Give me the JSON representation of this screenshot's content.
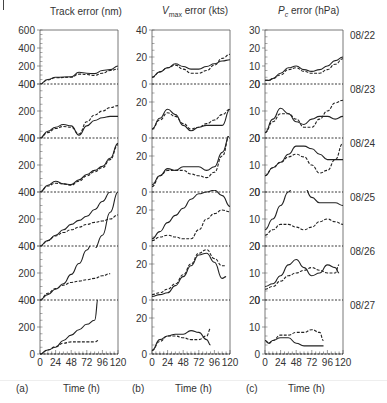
{
  "figure": {
    "panel_labels": [
      "(a)",
      "(b)",
      "(c)"
    ],
    "xlabel": "Time (h)",
    "x_ticks": [
      "0",
      "24",
      "48",
      "72",
      "96",
      "120"
    ],
    "dates": [
      "08/22",
      "08/23",
      "08/24",
      "08/25",
      "08/26",
      "08/27"
    ],
    "titles": [
      "Track error (nm)",
      "V",
      "max",
      " error (kts)",
      "P",
      "c",
      " error (hPa)"
    ]
  },
  "colors": {
    "line": "#222222",
    "axis": "#555555",
    "text": "#333333"
  },
  "chart_data": [
    {
      "type": "line",
      "title": "Track error (nm)",
      "panel": "(a)",
      "xlabel": "Time (h)",
      "ylabel": "Track error (nm)",
      "x_ticks": [
        0,
        24,
        48,
        72,
        96,
        120
      ],
      "y_ticks": [
        0,
        200,
        400,
        600
      ],
      "rows": [
        {
          "date": "08/22",
          "ylim": [
            0,
            600
          ],
          "x": [
            0,
            12,
            24,
            48,
            60,
            72,
            84,
            96,
            108,
            120
          ],
          "series": [
            {
              "name": "solid",
              "values": [
                0,
                50,
                75,
                80,
                130,
                120,
                115,
                150,
                160,
                200
              ]
            },
            {
              "name": "dashed",
              "values": [
                0,
                45,
                70,
                75,
                110,
                105,
                95,
                120,
                150,
                165
              ]
            }
          ]
        },
        {
          "date": "08/23",
          "ylim": [
            0,
            400
          ],
          "x": [
            0,
            12,
            24,
            36,
            48,
            60,
            72,
            84,
            96,
            108,
            120
          ],
          "series": [
            {
              "name": "solid",
              "values": [
                0,
                50,
                80,
                100,
                90,
                20,
                90,
                130,
                150,
                160,
                160
              ]
            },
            {
              "name": "dashed",
              "values": [
                0,
                40,
                70,
                85,
                80,
                30,
                120,
                170,
                200,
                225,
                240
              ]
            }
          ]
        },
        {
          "date": "08/24",
          "ylim": [
            0,
            400
          ],
          "x": [
            0,
            12,
            24,
            36,
            48,
            60,
            72,
            84,
            96,
            108,
            120
          ],
          "series": [
            {
              "name": "solid",
              "values": [
                0,
                50,
                80,
                60,
                55,
                90,
                130,
                160,
                190,
                250,
                360
              ]
            },
            {
              "name": "dashed",
              "values": [
                0,
                45,
                65,
                60,
                50,
                80,
                120,
                150,
                180,
                240,
                350
              ]
            }
          ]
        },
        {
          "date": "08/25",
          "ylim": [
            0,
            400
          ],
          "x": [
            0,
            12,
            24,
            36,
            48,
            60,
            72,
            84,
            96,
            108,
            120
          ],
          "series": [
            {
              "name": "solid",
              "values": [
                0,
                40,
                80,
                120,
                160,
                190,
                220,
                270,
                330,
                400,
                490
              ]
            },
            {
              "name": "dashed",
              "values": [
                0,
                40,
                75,
                100,
                120,
                140,
                160,
                175,
                185,
                200,
                230
              ]
            },
            {
              "name": "solid-2",
              "values": [
                null,
                null,
                null,
                null,
                null,
                null,
                -60,
                -20,
                80,
                250,
                400
              ]
            }
          ]
        },
        {
          "date": "08/26",
          "ylim": [
            0,
            400
          ],
          "x": [
            0,
            12,
            24,
            36,
            48,
            60,
            72,
            84,
            96,
            108
          ],
          "series": [
            {
              "name": "solid",
              "values": [
                0,
                40,
                80,
                120,
                190,
                270,
                370,
                480,
                null,
                null
              ]
            },
            {
              "name": "dashed",
              "values": [
                0,
                50,
                85,
                110,
                130,
                140,
                150,
                160,
                180,
                195
              ]
            }
          ]
        },
        {
          "date": "08/27",
          "ylim": [
            0,
            400
          ],
          "x": [
            0,
            12,
            24,
            36,
            48,
            60,
            72,
            84,
            90
          ],
          "series": [
            {
              "name": "solid",
              "values": [
                0,
                30,
                50,
                100,
                140,
                180,
                220,
                250,
                430
              ]
            },
            {
              "name": "dashed",
              "values": [
                0,
                30,
                55,
                80,
                90,
                90,
                90,
                90,
                100
              ]
            }
          ]
        }
      ]
    },
    {
      "type": "line",
      "title": "Vmax error (kts)",
      "panel": "(b)",
      "xlabel": "Time (h)",
      "ylabel": "Vmax error (kts)",
      "x_ticks": [
        0,
        24,
        48,
        72,
        96,
        120
      ],
      "y_ticks": [
        0,
        20,
        40
      ],
      "rows": [
        {
          "date": "08/22",
          "ylim": [
            0,
            40
          ],
          "x": [
            0,
            12,
            24,
            36,
            48,
            60,
            72,
            84,
            96,
            108,
            120
          ],
          "series": [
            {
              "name": "solid",
              "values": [
                5,
                9,
                12,
                15,
                13,
                11,
                11,
                13,
                15,
                17,
                18
              ]
            },
            {
              "name": "dashed",
              "values": [
                5,
                9,
                12,
                14,
                11,
                8,
                8,
                10,
                14,
                19,
                22
              ]
            }
          ]
        },
        {
          "date": "08/23",
          "ylim": [
            0,
            30
          ],
          "x": [
            0,
            12,
            24,
            36,
            48,
            60,
            72,
            84,
            96,
            108,
            120
          ],
          "series": [
            {
              "name": "solid",
              "values": [
                5,
                11,
                16,
                13,
                7,
                4,
                6,
                7,
                7,
                7,
                16
              ]
            },
            {
              "name": "dashed",
              "values": [
                5,
                10,
                14,
                12,
                8,
                5,
                6,
                8,
                10,
                13,
                16
              ]
            }
          ]
        },
        {
          "date": "08/24",
          "ylim": [
            0,
            30
          ],
          "x": [
            0,
            12,
            24,
            36,
            48,
            60,
            72,
            84,
            96,
            108,
            120
          ],
          "series": [
            {
              "name": "solid",
              "values": [
                4,
                9,
                13,
                12,
                14,
                14,
                14,
                12,
                14,
                22,
                32
              ]
            },
            {
              "name": "dashed",
              "values": [
                3,
                9,
                12,
                12,
                12,
                10,
                9,
                8,
                11,
                20,
                32
              ]
            }
          ]
        },
        {
          "date": "08/25",
          "ylim": [
            0,
            30
          ],
          "x": [
            0,
            12,
            24,
            36,
            48,
            60,
            72,
            84,
            96,
            108,
            120
          ],
          "series": [
            {
              "name": "solid",
              "values": [
                4,
                8,
                13,
                17,
                21,
                26,
                29,
                30,
                31,
                28,
                22
              ]
            },
            {
              "name": "dashed",
              "values": [
                3,
                5,
                6,
                5,
                4,
                4,
                9,
                15,
                18,
                20,
                19
              ]
            }
          ]
        },
        {
          "date": "08/26",
          "ylim": [
            0,
            30
          ],
          "x": [
            0,
            12,
            24,
            36,
            48,
            60,
            72,
            84,
            96,
            108,
            114
          ],
          "series": [
            {
              "name": "solid",
              "values": [
                2,
                3,
                4,
                8,
                13,
                19,
                25,
                26,
                21,
                12,
                13
              ]
            },
            {
              "name": "dashed",
              "values": [
                3,
                4,
                6,
                9,
                14,
                20,
                26,
                28,
                23,
                19,
                19
              ]
            }
          ]
        },
        {
          "date": "08/27",
          "ylim": [
            0,
            30
          ],
          "x": [
            0,
            12,
            24,
            36,
            48,
            60,
            72,
            84,
            90
          ],
          "series": [
            {
              "name": "solid",
              "values": [
                2,
                8,
                10,
                11,
                11,
                13,
                12,
                8,
                5
              ]
            },
            {
              "name": "dashed",
              "values": [
                2,
                7,
                10,
                10,
                9,
                8,
                8,
                10,
                14
              ]
            }
          ]
        }
      ]
    },
    {
      "type": "line",
      "title": "Pc error (hPa)",
      "panel": "(c)",
      "xlabel": "Time (h)",
      "ylabel": "Pc error (hPa)",
      "x_ticks": [
        0,
        24,
        48,
        72,
        96,
        120
      ],
      "y_ticks": [
        0,
        10,
        20,
        30
      ],
      "rows": [
        {
          "date": "08/22",
          "ylim": [
            0,
            30
          ],
          "x": [
            0,
            6,
            12,
            24,
            36,
            48,
            60,
            72,
            84,
            96,
            108,
            120
          ],
          "series": [
            {
              "name": "solid",
              "values": [
                2,
                2,
                3,
                6,
                9,
                10,
                8,
                7,
                8,
                10,
                13,
                15
              ]
            },
            {
              "name": "dashed",
              "values": [
                2,
                2,
                3,
                5,
                8,
                9,
                7,
                6,
                6,
                8,
                11,
                14
              ]
            }
          ]
        },
        {
          "date": "08/23",
          "ylim": [
            0,
            20
          ],
          "x": [
            0,
            12,
            24,
            36,
            48,
            60,
            72,
            84,
            96,
            108,
            120
          ],
          "series": [
            {
              "name": "solid",
              "values": [
                2,
                7,
                11,
                9,
                6,
                5,
                7,
                8,
                8,
                7,
                8
              ]
            },
            {
              "name": "dashed",
              "values": [
                2,
                6,
                9,
                9,
                7,
                4,
                4,
                7,
                10,
                13,
                14
              ]
            }
          ]
        },
        {
          "date": "08/24",
          "ylim": [
            0,
            20
          ],
          "x": [
            0,
            12,
            24,
            36,
            48,
            60,
            72,
            84,
            96,
            108,
            120
          ],
          "series": [
            {
              "name": "solid",
              "values": [
                6,
                9,
                11,
                14,
                17,
                17,
                16,
                14,
                12,
                12,
                12
              ]
            },
            {
              "name": "dashed",
              "values": [
                6,
                9,
                11,
                13,
                14,
                13,
                10,
                7,
                8,
                12,
                18
              ]
            }
          ]
        },
        {
          "date": "08/25",
          "ylim": [
            0,
            20
          ],
          "x": [
            0,
            12,
            24,
            36,
            48,
            60,
            72,
            84,
            96,
            108,
            120
          ],
          "series": [
            {
              "name": "solid",
              "values": [
                6,
                10,
                15,
                20,
                25,
                22,
                18,
                16,
                16,
                16,
                15
              ]
            },
            {
              "name": "dashed",
              "values": [
                4,
                6,
                8,
                8,
                7,
                6,
                7,
                9,
                10,
                9,
                8
              ]
            }
          ]
        },
        {
          "date": "08/26",
          "ylim": [
            0,
            20
          ],
          "x": [
            0,
            12,
            24,
            36,
            48,
            60,
            72,
            84,
            96,
            108,
            114
          ],
          "series": [
            {
              "name": "solid",
              "values": [
                5,
                6,
                9,
                13,
                15,
                12,
                9,
                10,
                13,
                12,
                10
              ]
            },
            {
              "name": "dashed",
              "values": [
                4,
                5,
                7,
                9,
                10,
                11,
                12,
                11,
                10,
                10,
                13
              ]
            }
          ]
        },
        {
          "date": "08/27",
          "ylim": [
            0,
            20
          ],
          "x": [
            0,
            6,
            12,
            24,
            36,
            48,
            60,
            72,
            84,
            90
          ],
          "series": [
            {
              "name": "solid",
              "values": [
                5,
                4,
                5,
                6,
                6,
                4,
                3,
                3,
                3,
                3
              ]
            },
            {
              "name": "dashed",
              "values": [
                5,
                4,
                5,
                7,
                7,
                8,
                8,
                9,
                8,
                5
              ]
            }
          ]
        }
      ]
    }
  ]
}
